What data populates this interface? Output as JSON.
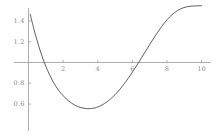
{
  "chart_data": {
    "type": "line",
    "title": "",
    "subtitle": "",
    "xlabel": "",
    "ylabel": "",
    "xlim": [
      0,
      10.2
    ],
    "ylim": [
      0.5,
      1.56
    ],
    "grid": false,
    "legend": null,
    "axis_color": "#9a9a9a",
    "curve_color": "#4d4d4d",
    "background_color": "#ffffff",
    "x_axis_position_value": 1.0,
    "xticks": [
      {
        "value": 2,
        "label": "2"
      },
      {
        "value": 4,
        "label": "4"
      },
      {
        "value": 6,
        "label": "6"
      },
      {
        "value": 8,
        "label": "8"
      },
      {
        "value": 10,
        "label": "10"
      }
    ],
    "yticks": [
      {
        "value": 1.4,
        "label": "1.4"
      },
      {
        "value": 1.2,
        "label": "1.2"
      },
      {
        "value": 0.8,
        "label": "0.8"
      },
      {
        "value": 0.6,
        "label": "0.6"
      }
    ],
    "series": [
      {
        "name": "curve",
        "x": [
          0.1,
          0.3,
          0.5,
          0.7,
          0.9,
          1.1,
          1.3,
          1.5,
          1.7,
          1.9,
          2.1,
          2.3,
          2.5,
          2.7,
          2.9,
          3.1,
          3.3,
          3.5,
          3.8,
          4.1,
          4.4,
          4.7,
          5.0,
          5.3,
          5.6,
          5.9,
          6.2,
          6.5,
          6.8,
          7.1,
          7.4,
          7.7,
          8.0,
          8.3,
          8.6,
          8.9,
          9.2,
          9.5,
          9.8,
          10.0
        ],
        "y": [
          1.463,
          1.329,
          1.209,
          1.101,
          1.006,
          0.925,
          0.854,
          0.793,
          0.742,
          0.7,
          0.664,
          0.633,
          0.608,
          0.588,
          0.573,
          0.563,
          0.558,
          0.556,
          0.562,
          0.579,
          0.606,
          0.643,
          0.69,
          0.746,
          0.81,
          0.881,
          0.957,
          1.036,
          1.117,
          1.198,
          1.275,
          1.346,
          1.409,
          1.46,
          1.498,
          1.523,
          1.537,
          1.543,
          1.545,
          1.546
        ]
      }
    ]
  }
}
